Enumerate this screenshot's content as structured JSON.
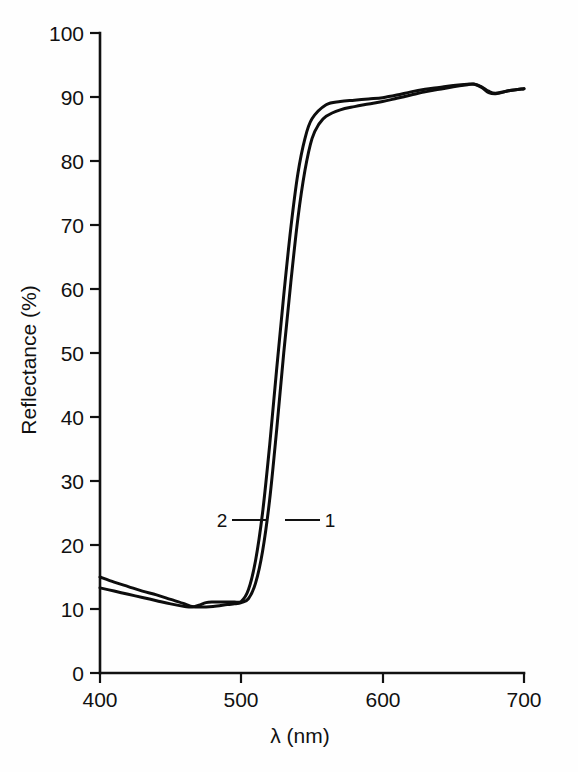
{
  "figure": {
    "background_color": "#fefefe",
    "line_color": "#0d0d0d",
    "axis_color": "#111111"
  },
  "axes": {
    "y_title": "Reflectance  (%)",
    "x_title": "λ (nm)",
    "y_ticks": [
      "0",
      "10",
      "20",
      "30",
      "40",
      "50",
      "60",
      "70",
      "80",
      "90",
      "100"
    ],
    "x_ticks": [
      "400",
      "500",
      "600",
      "700"
    ]
  },
  "annotations": {
    "curve_label_1": "1",
    "curve_label_2": "2"
  },
  "chart_data": {
    "type": "line",
    "title": "",
    "xlabel": "λ (nm)",
    "ylabel": "Reflectance (%)",
    "xlim": [
      400,
      700
    ],
    "ylim": [
      0,
      100
    ],
    "xticks": [
      400,
      500,
      600,
      700
    ],
    "yticks": [
      0,
      10,
      20,
      30,
      40,
      50,
      60,
      70,
      80,
      90,
      100
    ],
    "grid": false,
    "legend": "inline-labels",
    "series": [
      {
        "name": "1",
        "label_position": {
          "x": 545,
          "y": 23
        },
        "x": [
          400,
          410,
          420,
          430,
          440,
          450,
          460,
          465,
          470,
          480,
          490,
          495,
          500,
          505,
          510,
          515,
          520,
          525,
          530,
          535,
          540,
          545,
          550,
          555,
          560,
          570,
          580,
          590,
          600,
          610,
          620,
          630,
          640,
          650,
          660,
          665,
          670,
          675,
          680,
          690,
          700
        ],
        "y": [
          15.0,
          14.2,
          13.5,
          12.8,
          12.2,
          11.5,
          10.8,
          10.4,
          10.3,
          10.4,
          10.7,
          10.8,
          11.0,
          11.6,
          14.0,
          19.0,
          27.0,
          38.0,
          50.0,
          61.0,
          71.0,
          78.5,
          83.5,
          85.8,
          87.0,
          88.0,
          88.5,
          88.9,
          89.3,
          89.8,
          90.3,
          90.8,
          91.2,
          91.6,
          91.9,
          92.0,
          91.5,
          90.7,
          90.5,
          91.0,
          91.3
        ]
      },
      {
        "name": "2",
        "label_position": {
          "x": 490,
          "y": 23
        },
        "x": [
          400,
          410,
          420,
          430,
          440,
          450,
          460,
          465,
          470,
          475,
          480,
          485,
          490,
          495,
          500,
          505,
          510,
          515,
          520,
          525,
          530,
          535,
          540,
          545,
          550,
          560,
          570,
          580,
          590,
          600,
          610,
          620,
          630,
          640,
          650,
          660,
          665,
          670,
          675,
          680,
          690,
          700
        ],
        "y": [
          13.3,
          12.8,
          12.3,
          11.8,
          11.3,
          10.8,
          10.4,
          10.3,
          10.6,
          11.0,
          11.1,
          11.1,
          11.1,
          11.1,
          11.2,
          13.0,
          17.5,
          25.0,
          35.5,
          47.5,
          59.0,
          69.5,
          78.0,
          83.5,
          86.6,
          88.8,
          89.3,
          89.5,
          89.7,
          89.9,
          90.3,
          90.8,
          91.2,
          91.5,
          91.8,
          92.0,
          92.0,
          91.6,
          90.9,
          90.6,
          91.0,
          91.3
        ]
      }
    ]
  }
}
